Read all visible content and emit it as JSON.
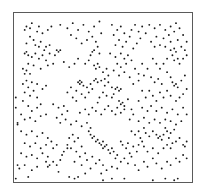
{
  "chart_data": {
    "type": "scatter",
    "title": "",
    "xlabel": "",
    "ylabel": "",
    "xlim": [
      0,
      1
    ],
    "ylim": [
      0,
      1
    ],
    "y_axis_direction": "top-to-bottom",
    "grid": false,
    "legend": null,
    "frame": true,
    "marker_color": "#1a1a1a",
    "frame_color": "#5a5a5a",
    "marker_size_px": 1.6,
    "points": [
      [
        0.07,
        0.08
      ],
      [
        0.09,
        0.09
      ],
      [
        0.06,
        0.1
      ],
      [
        0.1,
        0.06
      ],
      [
        0.13,
        0.11
      ],
      [
        0.14,
        0.08
      ],
      [
        0.16,
        0.12
      ],
      [
        0.19,
        0.1
      ],
      [
        0.21,
        0.08
      ],
      [
        0.09,
        0.14
      ],
      [
        0.11,
        0.16
      ],
      [
        0.07,
        0.18
      ],
      [
        0.12,
        0.19
      ],
      [
        0.15,
        0.17
      ],
      [
        0.18,
        0.2
      ],
      [
        0.2,
        0.19
      ],
      [
        0.17,
        0.22
      ],
      [
        0.14,
        0.2
      ],
      [
        0.06,
        0.24
      ],
      [
        0.08,
        0.25
      ],
      [
        0.07,
        0.23
      ],
      [
        0.1,
        0.26
      ],
      [
        0.12,
        0.24
      ],
      [
        0.14,
        0.27
      ],
      [
        0.16,
        0.25
      ],
      [
        0.18,
        0.28
      ],
      [
        0.2,
        0.24
      ],
      [
        0.23,
        0.25
      ],
      [
        0.25,
        0.23
      ],
      [
        0.26,
        0.22
      ],
      [
        0.24,
        0.22
      ],
      [
        0.22,
        0.3
      ],
      [
        0.19,
        0.31
      ],
      [
        0.15,
        0.33
      ],
      [
        0.11,
        0.31
      ],
      [
        0.08,
        0.3
      ],
      [
        0.05,
        0.33
      ],
      [
        0.06,
        0.36
      ],
      [
        0.09,
        0.36
      ],
      [
        0.07,
        0.34
      ],
      [
        0.05,
        0.42
      ],
      [
        0.07,
        0.4
      ],
      [
        0.08,
        0.44
      ],
      [
        0.1,
        0.41
      ],
      [
        0.13,
        0.42
      ],
      [
        0.06,
        0.47
      ],
      [
        0.09,
        0.49
      ],
      [
        0.11,
        0.46
      ],
      [
        0.13,
        0.5
      ],
      [
        0.16,
        0.45
      ],
      [
        0.18,
        0.43
      ],
      [
        0.05,
        0.52
      ],
      [
        0.08,
        0.55
      ],
      [
        0.1,
        0.58
      ],
      [
        0.13,
        0.56
      ],
      [
        0.15,
        0.54
      ],
      [
        0.04,
        0.6
      ],
      [
        0.06,
        0.63
      ],
      [
        0.09,
        0.62
      ],
      [
        0.12,
        0.64
      ],
      [
        0.15,
        0.61
      ],
      [
        0.18,
        0.6
      ],
      [
        0.02,
        0.65
      ],
      [
        0.02,
        0.66
      ],
      [
        0.04,
        0.7
      ],
      [
        0.07,
        0.72
      ],
      [
        0.1,
        0.7
      ],
      [
        0.13,
        0.73
      ],
      [
        0.16,
        0.71
      ],
      [
        0.19,
        0.74
      ],
      [
        0.06,
        0.77
      ],
      [
        0.09,
        0.79
      ],
      [
        0.12,
        0.77
      ],
      [
        0.15,
        0.8
      ],
      [
        0.18,
        0.78
      ],
      [
        0.21,
        0.76
      ],
      [
        0.24,
        0.78
      ],
      [
        0.22,
        0.8
      ],
      [
        0.04,
        0.83
      ],
      [
        0.07,
        0.85
      ],
      [
        0.1,
        0.84
      ],
      [
        0.13,
        0.86
      ],
      [
        0.16,
        0.83
      ],
      [
        0.19,
        0.85
      ],
      [
        0.18,
        0.88
      ],
      [
        0.2,
        0.9
      ],
      [
        0.19,
        0.91
      ],
      [
        0.22,
        0.88
      ],
      [
        0.24,
        0.9
      ],
      [
        0.26,
        0.87
      ],
      [
        0.28,
        0.82
      ],
      [
        0.27,
        0.84
      ],
      [
        0.3,
        0.8
      ],
      [
        0.25,
        0.94
      ],
      [
        0.13,
        0.91
      ],
      [
        0.1,
        0.93
      ],
      [
        0.06,
        0.9
      ],
      [
        0.03,
        0.92
      ],
      [
        0.02,
        0.9
      ],
      [
        0.08,
        0.97
      ],
      [
        0.26,
        0.07
      ],
      [
        0.3,
        0.09
      ],
      [
        0.33,
        0.06
      ],
      [
        0.36,
        0.1
      ],
      [
        0.39,
        0.07
      ],
      [
        0.42,
        0.11
      ],
      [
        0.45,
        0.08
      ],
      [
        0.48,
        0.05
      ],
      [
        0.44,
        0.14
      ],
      [
        0.41,
        0.16
      ],
      [
        0.38,
        0.18
      ],
      [
        0.35,
        0.15
      ],
      [
        0.32,
        0.13
      ],
      [
        0.46,
        0.17
      ],
      [
        0.49,
        0.12
      ],
      [
        0.47,
        0.2
      ],
      [
        0.45,
        0.22
      ],
      [
        0.48,
        0.24
      ],
      [
        0.43,
        0.25
      ],
      [
        0.44,
        0.23
      ],
      [
        0.28,
        0.29
      ],
      [
        0.31,
        0.32
      ],
      [
        0.34,
        0.3
      ],
      [
        0.36,
        0.27
      ],
      [
        0.4,
        0.3
      ],
      [
        0.42,
        0.28
      ],
      [
        0.45,
        0.31
      ],
      [
        0.48,
        0.32
      ],
      [
        0.47,
        0.3
      ],
      [
        0.46,
        0.33
      ],
      [
        0.5,
        0.35
      ],
      [
        0.52,
        0.33
      ],
      [
        0.53,
        0.37
      ],
      [
        0.51,
        0.39
      ],
      [
        0.36,
        0.41
      ],
      [
        0.37,
        0.42
      ],
      [
        0.38,
        0.41
      ],
      [
        0.39,
        0.43
      ],
      [
        0.37,
        0.4
      ],
      [
        0.41,
        0.44
      ],
      [
        0.43,
        0.42
      ],
      [
        0.45,
        0.4
      ],
      [
        0.46,
        0.39
      ],
      [
        0.47,
        0.41
      ],
      [
        0.44,
        0.45
      ],
      [
        0.42,
        0.47
      ],
      [
        0.4,
        0.5
      ],
      [
        0.38,
        0.48
      ],
      [
        0.35,
        0.46
      ],
      [
        0.32,
        0.44
      ],
      [
        0.3,
        0.47
      ],
      [
        0.33,
        0.5
      ],
      [
        0.35,
        0.52
      ],
      [
        0.49,
        0.4
      ],
      [
        0.51,
        0.43
      ],
      [
        0.53,
        0.41
      ],
      [
        0.55,
        0.44
      ],
      [
        0.57,
        0.45
      ],
      [
        0.58,
        0.44
      ],
      [
        0.59,
        0.46
      ],
      [
        0.6,
        0.45
      ],
      [
        0.56,
        0.48
      ],
      [
        0.55,
        0.5
      ],
      [
        0.52,
        0.49
      ],
      [
        0.5,
        0.47
      ],
      [
        0.48,
        0.5
      ],
      [
        0.47,
        0.53
      ],
      [
        0.59,
        0.52
      ],
      [
        0.6,
        0.54
      ],
      [
        0.61,
        0.53
      ],
      [
        0.62,
        0.55
      ],
      [
        0.64,
        0.51
      ],
      [
        0.62,
        0.57
      ],
      [
        0.6,
        0.59
      ],
      [
        0.58,
        0.56
      ],
      [
        0.57,
        0.6
      ],
      [
        0.55,
        0.58
      ],
      [
        0.53,
        0.55
      ],
      [
        0.51,
        0.57
      ],
      [
        0.49,
        0.6
      ],
      [
        0.46,
        0.58
      ],
      [
        0.44,
        0.56
      ],
      [
        0.42,
        0.6
      ],
      [
        0.4,
        0.57
      ],
      [
        0.37,
        0.59
      ],
      [
        0.22,
        0.54
      ],
      [
        0.25,
        0.56
      ],
      [
        0.28,
        0.55
      ],
      [
        0.3,
        0.58
      ],
      [
        0.27,
        0.6
      ],
      [
        0.24,
        0.62
      ],
      [
        0.26,
        0.65
      ],
      [
        0.29,
        0.63
      ],
      [
        0.32,
        0.66
      ],
      [
        0.35,
        0.64
      ],
      [
        0.38,
        0.67
      ],
      [
        0.41,
        0.65
      ],
      [
        0.43,
        0.68
      ],
      [
        0.42,
        0.7
      ],
      [
        0.43,
        0.72
      ],
      [
        0.44,
        0.74
      ],
      [
        0.45,
        0.73
      ],
      [
        0.46,
        0.76
      ],
      [
        0.47,
        0.75
      ],
      [
        0.48,
        0.77
      ],
      [
        0.5,
        0.76
      ],
      [
        0.49,
        0.78
      ],
      [
        0.51,
        0.79
      ],
      [
        0.5,
        0.8
      ],
      [
        0.52,
        0.78
      ],
      [
        0.53,
        0.81
      ],
      [
        0.55,
        0.8
      ],
      [
        0.54,
        0.83
      ],
      [
        0.56,
        0.82
      ],
      [
        0.58,
        0.84
      ],
      [
        0.57,
        0.86
      ],
      [
        0.33,
        0.72
      ],
      [
        0.36,
        0.74
      ],
      [
        0.34,
        0.76
      ],
      [
        0.31,
        0.74
      ],
      [
        0.3,
        0.78
      ],
      [
        0.32,
        0.8
      ],
      [
        0.35,
        0.82
      ],
      [
        0.38,
        0.79
      ],
      [
        0.4,
        0.83
      ],
      [
        0.37,
        0.85
      ],
      [
        0.34,
        0.88
      ],
      [
        0.38,
        0.9
      ],
      [
        0.41,
        0.87
      ],
      [
        0.44,
        0.85
      ],
      [
        0.46,
        0.89
      ],
      [
        0.43,
        0.92
      ],
      [
        0.4,
        0.95
      ],
      [
        0.36,
        0.97
      ],
      [
        0.48,
        0.87
      ],
      [
        0.5,
        0.9
      ],
      [
        0.52,
        0.93
      ],
      [
        0.49,
        0.95
      ],
      [
        0.55,
        0.91
      ],
      [
        0.58,
        0.92
      ],
      [
        0.6,
        0.88
      ],
      [
        0.62,
        0.86
      ],
      [
        0.64,
        0.89
      ],
      [
        0.66,
        0.85
      ],
      [
        0.65,
        0.83
      ],
      [
        0.63,
        0.8
      ],
      [
        0.61,
        0.78
      ],
      [
        0.6,
        0.76
      ],
      [
        0.64,
        0.77
      ],
      [
        0.67,
        0.79
      ],
      [
        0.69,
        0.82
      ],
      [
        0.7,
        0.78
      ],
      [
        0.72,
        0.76
      ],
      [
        0.71,
        0.74
      ],
      [
        0.66,
        0.7
      ],
      [
        0.68,
        0.72
      ],
      [
        0.7,
        0.7
      ],
      [
        0.73,
        0.68
      ],
      [
        0.74,
        0.71
      ],
      [
        0.76,
        0.73
      ],
      [
        0.78,
        0.7
      ],
      [
        0.8,
        0.72
      ],
      [
        0.81,
        0.74
      ],
      [
        0.82,
        0.73
      ],
      [
        0.83,
        0.75
      ],
      [
        0.84,
        0.72
      ],
      [
        0.86,
        0.7
      ],
      [
        0.85,
        0.68
      ],
      [
        0.88,
        0.71
      ],
      [
        0.9,
        0.69
      ],
      [
        0.87,
        0.74
      ],
      [
        0.89,
        0.77
      ],
      [
        0.86,
        0.78
      ],
      [
        0.84,
        0.8
      ],
      [
        0.88,
        0.8
      ],
      [
        0.91,
        0.76
      ],
      [
        0.93,
        0.74
      ],
      [
        0.95,
        0.78
      ],
      [
        0.97,
        0.76
      ],
      [
        0.96,
        0.79
      ],
      [
        0.55,
        0.07
      ],
      [
        0.58,
        0.1
      ],
      [
        0.56,
        0.13
      ],
      [
        0.6,
        0.08
      ],
      [
        0.62,
        0.12
      ],
      [
        0.59,
        0.16
      ],
      [
        0.57,
        0.19
      ],
      [
        0.61,
        0.2
      ],
      [
        0.63,
        0.17
      ],
      [
        0.65,
        0.14
      ],
      [
        0.66,
        0.1
      ],
      [
        0.68,
        0.07
      ],
      [
        0.7,
        0.11
      ],
      [
        0.72,
        0.08
      ],
      [
        0.74,
        0.12
      ],
      [
        0.71,
        0.15
      ],
      [
        0.69,
        0.18
      ],
      [
        0.67,
        0.21
      ],
      [
        0.54,
        0.24
      ],
      [
        0.57,
        0.26
      ],
      [
        0.6,
        0.24
      ],
      [
        0.62,
        0.27
      ],
      [
        0.64,
        0.25
      ],
      [
        0.66,
        0.28
      ],
      [
        0.63,
        0.3
      ],
      [
        0.6,
        0.32
      ],
      [
        0.58,
        0.3
      ],
      [
        0.56,
        0.34
      ],
      [
        0.59,
        0.37
      ],
      [
        0.62,
        0.35
      ],
      [
        0.65,
        0.38
      ],
      [
        0.68,
        0.33
      ],
      [
        0.7,
        0.36
      ],
      [
        0.72,
        0.3
      ],
      [
        0.75,
        0.33
      ],
      [
        0.73,
        0.37
      ],
      [
        0.7,
        0.4
      ],
      [
        0.67,
        0.42
      ],
      [
        0.76,
        0.07
      ],
      [
        0.79,
        0.09
      ],
      [
        0.82,
        0.07
      ],
      [
        0.85,
        0.1
      ],
      [
        0.88,
        0.08
      ],
      [
        0.91,
        0.06
      ],
      [
        0.9,
        0.11
      ],
      [
        0.87,
        0.13
      ],
      [
        0.84,
        0.15
      ],
      [
        0.8,
        0.14
      ],
      [
        0.77,
        0.17
      ],
      [
        0.79,
        0.2
      ],
      [
        0.82,
        0.19
      ],
      [
        0.85,
        0.2
      ],
      [
        0.88,
        0.17
      ],
      [
        0.93,
        0.09
      ],
      [
        0.95,
        0.13
      ],
      [
        0.92,
        0.16
      ],
      [
        0.94,
        0.2
      ],
      [
        0.97,
        0.17
      ],
      [
        0.88,
        0.22
      ],
      [
        0.9,
        0.21
      ],
      [
        0.91,
        0.23
      ],
      [
        0.89,
        0.25
      ],
      [
        0.92,
        0.27
      ],
      [
        0.9,
        0.28
      ],
      [
        0.93,
        0.3
      ],
      [
        0.95,
        0.27
      ],
      [
        0.97,
        0.25
      ],
      [
        0.96,
        0.22
      ],
      [
        0.86,
        0.27
      ],
      [
        0.84,
        0.3
      ],
      [
        0.82,
        0.33
      ],
      [
        0.8,
        0.3
      ],
      [
        0.78,
        0.27
      ],
      [
        0.77,
        0.38
      ],
      [
        0.79,
        0.41
      ],
      [
        0.81,
        0.39
      ],
      [
        0.83,
        0.42
      ],
      [
        0.86,
        0.35
      ],
      [
        0.88,
        0.38
      ],
      [
        0.89,
        0.41
      ],
      [
        0.9,
        0.43
      ],
      [
        0.91,
        0.42
      ],
      [
        0.92,
        0.44
      ],
      [
        0.94,
        0.4
      ],
      [
        0.96,
        0.37
      ],
      [
        0.97,
        0.45
      ],
      [
        0.95,
        0.48
      ],
      [
        0.93,
        0.5
      ],
      [
        0.91,
        0.52
      ],
      [
        0.88,
        0.49
      ],
      [
        0.86,
        0.46
      ],
      [
        0.84,
        0.5
      ],
      [
        0.82,
        0.47
      ],
      [
        0.8,
        0.52
      ],
      [
        0.78,
        0.49
      ],
      [
        0.76,
        0.46
      ],
      [
        0.74,
        0.5
      ],
      [
        0.72,
        0.46
      ],
      [
        0.7,
        0.52
      ],
      [
        0.72,
        0.56
      ],
      [
        0.75,
        0.58
      ],
      [
        0.77,
        0.55
      ],
      [
        0.8,
        0.58
      ],
      [
        0.83,
        0.56
      ],
      [
        0.86,
        0.59
      ],
      [
        0.89,
        0.57
      ],
      [
        0.92,
        0.6
      ],
      [
        0.95,
        0.56
      ],
      [
        0.97,
        0.6
      ],
      [
        0.94,
        0.64
      ],
      [
        0.91,
        0.66
      ],
      [
        0.88,
        0.64
      ],
      [
        0.85,
        0.63
      ],
      [
        0.82,
        0.65
      ],
      [
        0.79,
        0.63
      ],
      [
        0.76,
        0.65
      ],
      [
        0.73,
        0.62
      ],
      [
        0.7,
        0.64
      ],
      [
        0.67,
        0.6
      ],
      [
        0.65,
        0.63
      ],
      [
        0.66,
        0.57
      ],
      [
        0.68,
        0.9
      ],
      [
        0.7,
        0.93
      ],
      [
        0.73,
        0.88
      ],
      [
        0.75,
        0.91
      ],
      [
        0.78,
        0.86
      ],
      [
        0.8,
        0.89
      ],
      [
        0.83,
        0.92
      ],
      [
        0.86,
        0.88
      ],
      [
        0.88,
        0.9
      ],
      [
        0.91,
        0.86
      ],
      [
        0.93,
        0.88
      ],
      [
        0.95,
        0.84
      ],
      [
        0.97,
        0.86
      ],
      [
        0.75,
        0.82
      ],
      [
        0.78,
        0.8
      ],
      [
        0.81,
        0.83
      ],
      [
        0.73,
        0.79
      ],
      [
        0.31,
        0.97
      ],
      [
        0.34,
        0.98
      ],
      [
        0.5,
        0.99
      ],
      [
        0.55,
        0.98
      ],
      [
        0.62,
        0.98
      ],
      [
        0.78,
        0.99
      ],
      [
        0.85,
        0.98
      ],
      [
        0.9,
        0.99
      ],
      [
        0.92,
        0.98
      ],
      [
        0.01,
        0.98
      ],
      [
        0.01,
        0.5
      ],
      [
        0.01,
        0.56
      ]
    ]
  }
}
